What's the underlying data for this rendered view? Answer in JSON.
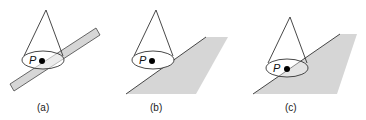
{
  "figure": {
    "panels": [
      {
        "id": "a",
        "caption": "(a)",
        "point_label": "P",
        "surface": "narrow strip"
      },
      {
        "id": "b",
        "caption": "(b)",
        "point_label": "P",
        "surface": "half-plane, point near edge"
      },
      {
        "id": "c",
        "caption": "(c)",
        "point_label": "P",
        "surface": "half-plane, point on surface"
      }
    ],
    "colors": {
      "surface_fill": "#d6d6d6",
      "line": "#333333",
      "point": "#000000"
    }
  }
}
